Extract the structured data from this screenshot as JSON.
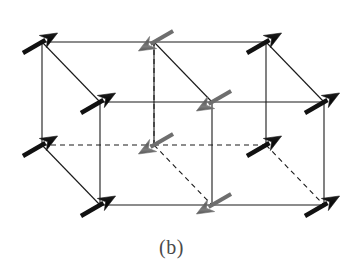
{
  "figure": {
    "label": "(b)",
    "caption_label": "(b)",
    "kind": "magnetic-structure-diagram",
    "background_color": "#ffffff"
  },
  "style": {
    "edge_color": "#1a1a1a",
    "edge_width": 1.1,
    "dash_pattern": "5,4",
    "spin_up_color": "#111111",
    "spin_down_color": "#6e6e6e",
    "label_color": "#4a4a4a"
  },
  "legend": {
    "spin_up_name": "black-arrow-spin-up",
    "spin_down_name": "gray-arrow-spin-down",
    "spin_up_direction": "up-right",
    "spin_down_direction": "up-left"
  },
  "chart_data": {
    "type": "diagram",
    "title": "(b)",
    "projection": {
      "origin_x": 42,
      "origin_y": 145,
      "ax": 112,
      "ay": 0,
      "bx": 0,
      "by": -103,
      "cx": 58,
      "cy": 60
    },
    "cells": [
      {
        "name": "left-cell",
        "i": 0
      },
      {
        "name": "right-cell",
        "i": 1
      }
    ],
    "vertices": [
      {
        "id": "v000",
        "i": 0,
        "j": 0,
        "k": 0,
        "x": 42,
        "y": 145,
        "spin": "up",
        "color": "#111111"
      },
      {
        "id": "v010",
        "i": 0,
        "j": 1,
        "k": 0,
        "x": 42,
        "y": 42,
        "spin": "up",
        "color": "#111111"
      },
      {
        "id": "v001",
        "i": 0,
        "j": 0,
        "k": 1,
        "x": 100,
        "y": 205,
        "spin": "up",
        "color": "#111111"
      },
      {
        "id": "v011",
        "i": 0,
        "j": 1,
        "k": 1,
        "x": 100,
        "y": 102,
        "spin": "up",
        "color": "#111111"
      },
      {
        "id": "v100",
        "i": 1,
        "j": 0,
        "k": 0,
        "x": 154,
        "y": 145,
        "spin": "down",
        "color": "#6e6e6e"
      },
      {
        "id": "v110",
        "i": 1,
        "j": 1,
        "k": 0,
        "x": 154,
        "y": 42,
        "spin": "down",
        "color": "#6e6e6e"
      },
      {
        "id": "v101",
        "i": 1,
        "j": 0,
        "k": 1,
        "x": 212,
        "y": 205,
        "spin": "down",
        "color": "#6e6e6e"
      },
      {
        "id": "v111",
        "i": 1,
        "j": 1,
        "k": 1,
        "x": 212,
        "y": 102,
        "spin": "down",
        "color": "#6e6e6e"
      },
      {
        "id": "v200",
        "i": 2,
        "j": 0,
        "k": 0,
        "x": 266,
        "y": 145,
        "spin": "up",
        "color": "#111111"
      },
      {
        "id": "v210",
        "i": 2,
        "j": 1,
        "k": 0,
        "x": 266,
        "y": 42,
        "spin": "up",
        "color": "#111111"
      },
      {
        "id": "v201",
        "i": 2,
        "j": 0,
        "k": 1,
        "x": 324,
        "y": 205,
        "spin": "up",
        "color": "#111111"
      },
      {
        "id": "v211",
        "i": 2,
        "j": 1,
        "k": 1,
        "x": 324,
        "y": 102,
        "spin": "up",
        "color": "#111111"
      }
    ],
    "arrow_geometry": {
      "shaft_length": 40,
      "head_length": 17,
      "head_half_width": 7,
      "up_angle_deg": -30,
      "down_angle_deg": 150
    },
    "edges_solid": [
      {
        "from": "v010",
        "to": "v110"
      },
      {
        "from": "v110",
        "to": "v210"
      },
      {
        "from": "v010",
        "to": "v000"
      },
      {
        "from": "v010",
        "to": "v011"
      },
      {
        "from": "v110",
        "to": "v111"
      },
      {
        "from": "v210",
        "to": "v211"
      },
      {
        "from": "v011",
        "to": "v111"
      },
      {
        "from": "v111",
        "to": "v211"
      },
      {
        "from": "v011",
        "to": "v001"
      },
      {
        "from": "v111",
        "to": "v101"
      },
      {
        "from": "v211",
        "to": "v201"
      },
      {
        "from": "v001",
        "to": "v101"
      },
      {
        "from": "v101",
        "to": "v201"
      },
      {
        "from": "v000",
        "to": "v001"
      },
      {
        "from": "v110",
        "to": "v100"
      },
      {
        "from": "v210",
        "to": "v200"
      }
    ],
    "edges_dashed": [
      {
        "from": "v000",
        "to": "v100"
      },
      {
        "from": "v100",
        "to": "v200"
      },
      {
        "from": "v100",
        "to": "v101"
      },
      {
        "from": "v200",
        "to": "v201"
      },
      {
        "from": "v100",
        "to": "v110"
      }
    ]
  }
}
